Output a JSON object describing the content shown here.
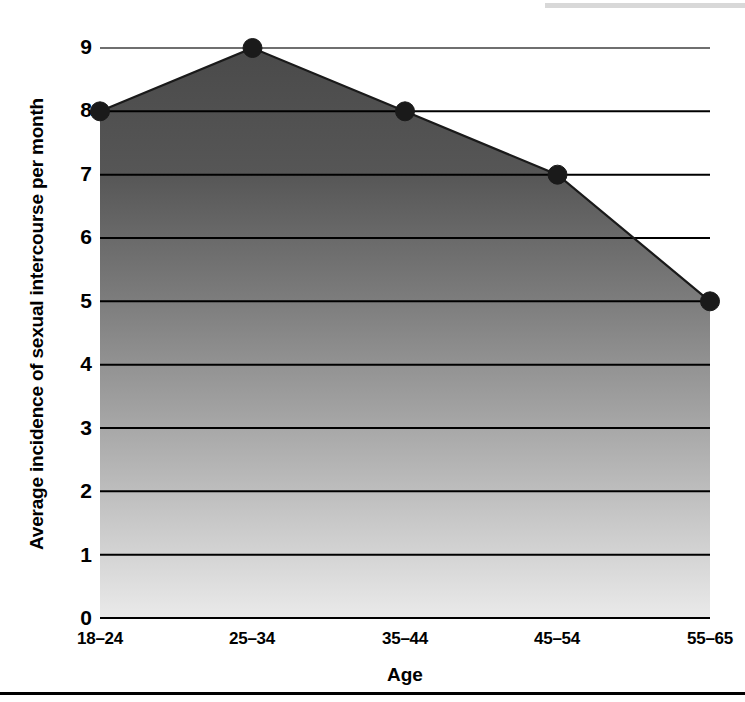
{
  "chart_data": {
    "type": "area",
    "title": "",
    "xlabel": "Age",
    "ylabel": "Average incidence of sexual intercourse per month",
    "categories": [
      "18–24",
      "25–34",
      "35–44",
      "45–54",
      "55–65"
    ],
    "values": [
      8,
      9,
      8,
      7,
      5
    ],
    "series": [
      {
        "name": "Average incidence of sexual intercourse per month",
        "values": [
          8,
          9,
          8,
          7,
          5
        ]
      }
    ],
    "ylim": [
      0,
      9
    ],
    "ytick_labels": [
      "0",
      "1",
      "2",
      "3",
      "4",
      "5",
      "6",
      "7",
      "8",
      "9"
    ],
    "ytick_values": [
      0,
      1,
      2,
      3,
      4,
      5,
      6,
      7,
      8,
      9
    ],
    "grid": true,
    "gridline_color": "#000000",
    "legend": "none",
    "marker": "filled-circle",
    "marker_color": "#1a1a1a",
    "fill_gradient_top": "#4a4a4a",
    "fill_gradient_bottom": "#e6e6e6",
    "line_color": "#1a1a1a",
    "background": "#ffffff"
  }
}
